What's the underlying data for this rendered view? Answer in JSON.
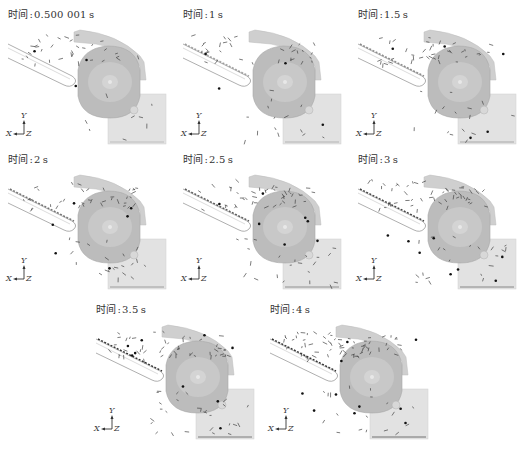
{
  "figure": {
    "time_prefix": "时间",
    "separator": ":",
    "panels": [
      {
        "id": "t0",
        "time_value": "0.500 001",
        "unit": "s",
        "fill_level": 0
      },
      {
        "id": "t1",
        "time_value": "1",
        "unit": "s",
        "fill_level": 1
      },
      {
        "id": "t2",
        "time_value": "1.5",
        "unit": "s",
        "fill_level": 2
      },
      {
        "id": "t3",
        "time_value": "2",
        "unit": "s",
        "fill_level": 3
      },
      {
        "id": "t4",
        "time_value": "2.5",
        "unit": "s",
        "fill_level": 4
      },
      {
        "id": "t5",
        "time_value": "3",
        "unit": "s",
        "fill_level": 5
      },
      {
        "id": "t6",
        "time_value": "3.5",
        "unit": "s",
        "fill_level": 6
      },
      {
        "id": "t7",
        "time_value": "4",
        "unit": "s",
        "fill_level": 7
      }
    ],
    "axis_triad": {
      "y_label": "Y",
      "x_label": "X",
      "z_label": "Z"
    },
    "colors": {
      "housing": "#cfcfcf",
      "drum": "#b9b9b9",
      "drum_inner": "#c8c8c8",
      "outlet_box": "#e2e2e2",
      "chute_outline": "#9a9a9a",
      "particle": "#333333"
    }
  }
}
